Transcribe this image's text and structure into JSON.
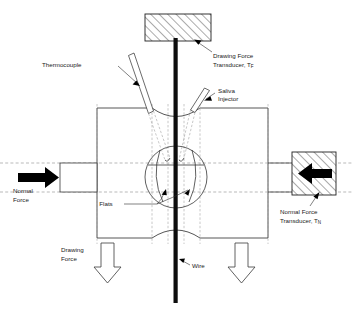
{
  "figure": {
    "background_color": "#ffffff",
    "line_color": "#2b2b2b",
    "dashed_color": "#8c8c8c",
    "accent_color": "#000000"
  },
  "labels": {
    "thermocouple": "Thermocouple",
    "drawing_force_transducer_line1": "Drawing Force",
    "drawing_force_transducer_line2": "Transducer, T",
    "drawing_force_transducer_subscript": "F",
    "saliva_injector_line1": "Saliva",
    "saliva_injector_line2": "Injector",
    "normal_force_line1": "Normal",
    "normal_force_line2": "Force",
    "normal_force_transducer_line1": "Normal Force",
    "normal_force_transducer_line2": "Transducer, T",
    "normal_force_transducer_subscript": "N",
    "flats": "Flats",
    "drawing_force_line1": "Drawing",
    "drawing_force_line2": "Force",
    "wire": "Wire"
  },
  "components": {
    "top_grip_block": "drawing-force-transducer-block",
    "right_transducer_block": "normal-force-transducer-block",
    "left_loading_ram": "normal-force-loading-ram",
    "die_body": "split-die-body",
    "die_bore_circle": "die-bore-circle",
    "wire_specimen": "wire-specimen",
    "thermocouple_probe": "thermocouple-probe",
    "saliva_injector_probe": "saliva-injector-probe",
    "left_force_arrow": "normal-force-arrow-left",
    "right_force_arrow": "normal-force-arrow-right",
    "drawing_arrow_left": "drawing-force-arrow-left",
    "drawing_arrow_right": "drawing-force-arrow-right"
  }
}
